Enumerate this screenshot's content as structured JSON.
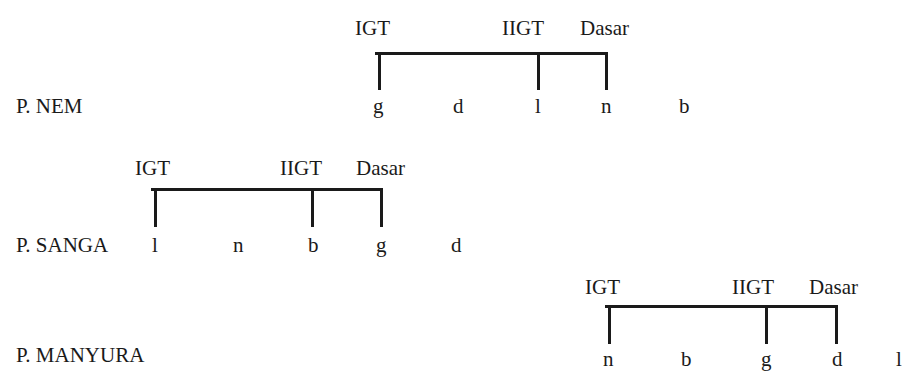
{
  "diagrams": [
    {
      "name": "P. NEM",
      "label": "P. NEM",
      "markers": [
        "IGT",
        "IIGT",
        "Dasar"
      ],
      "letters": [
        "g",
        "d",
        "l",
        "n",
        "b"
      ]
    },
    {
      "name": "P. SANGA",
      "label": "P. SANGA",
      "markers": [
        "IGT",
        "IIGT",
        "Dasar"
      ],
      "letters": [
        "l",
        "n",
        "b",
        "g",
        "d"
      ]
    },
    {
      "name": "P. MANYURA",
      "label": "P. MANYURA",
      "markers": [
        "IGT",
        "IIGT",
        "Dasar"
      ],
      "letters": [
        "n",
        "b",
        "g",
        "d",
        "l"
      ]
    }
  ]
}
